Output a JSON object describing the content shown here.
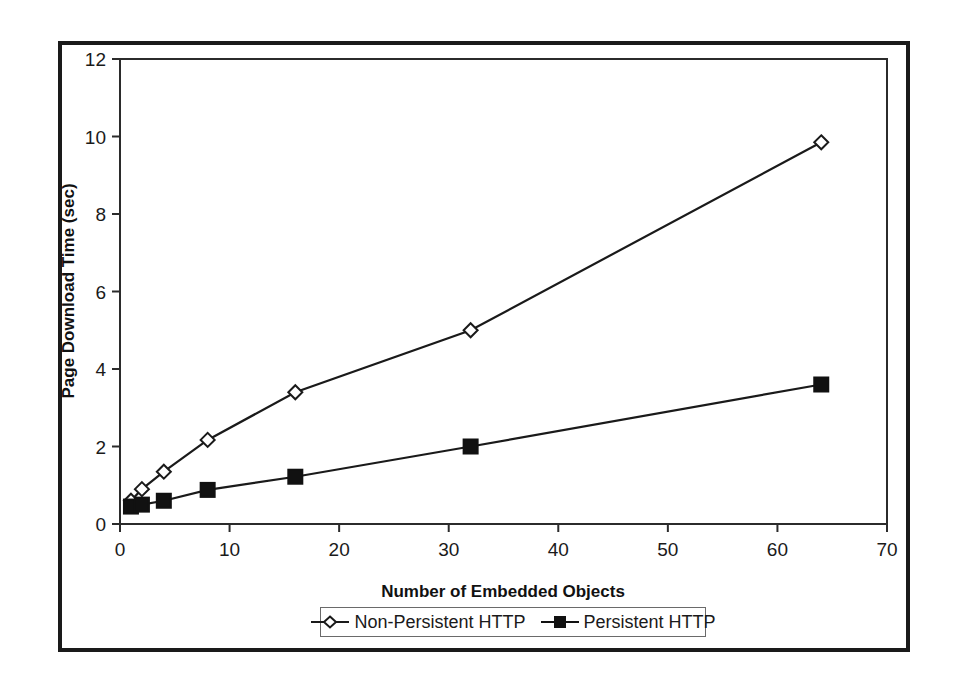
{
  "chart_data": {
    "type": "line",
    "title": "",
    "xlabel": "Number of Embedded Objects",
    "ylabel": "Page Download Time (sec)",
    "xlim": [
      0,
      70
    ],
    "ylim": [
      0,
      12
    ],
    "xticks": [
      "0",
      "10",
      "20",
      "30",
      "40",
      "50",
      "60",
      "70"
    ],
    "xtick_values": [
      0,
      10,
      20,
      30,
      40,
      50,
      60,
      70
    ],
    "yticks": [
      "0",
      "2",
      "4",
      "6",
      "8",
      "10",
      "12"
    ],
    "ytick_values": [
      0,
      2,
      4,
      6,
      8,
      10,
      12
    ],
    "grid": false,
    "legend_position": "bottom-center",
    "x": [
      1,
      2,
      4,
      8,
      16,
      32,
      64
    ],
    "series": [
      {
        "name": "Non-Persistent HTTP",
        "marker": "open-diamond",
        "color": "#1a1a1a",
        "values": [
          0.6,
          0.9,
          1.35,
          2.17,
          3.4,
          5.0,
          9.85
        ]
      },
      {
        "name": "Persistent HTTP",
        "marker": "filled-square",
        "color": "#111111",
        "values": [
          0.45,
          0.5,
          0.6,
          0.88,
          1.22,
          2.0,
          3.6
        ]
      }
    ]
  },
  "legend": {
    "entries": [
      {
        "label": "Non-Persistent HTTP"
      },
      {
        "label": "Persistent HTTP"
      }
    ]
  },
  "axes": {
    "x_title": "Number of Embedded Objects",
    "y_title": "Page Download Time (sec)"
  },
  "colors": {
    "frame": "#1a1a1a",
    "axis": "#2b2b2b",
    "series_1": "#1a1a1a",
    "series_2": "#111111",
    "background": "#ffffff"
  }
}
